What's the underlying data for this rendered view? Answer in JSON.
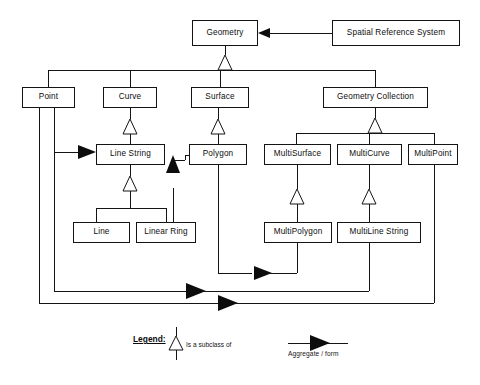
{
  "diagram": {
    "type": "uml-class-diagram",
    "stroke_color": "#141414",
    "fill_color": "#ffffff",
    "nodes": [
      {
        "id": "geometry",
        "label": "Geometry",
        "x": 192,
        "y": 20,
        "w": 66,
        "h": 26
      },
      {
        "id": "srs",
        "label": "Spatial Reference System",
        "x": 332,
        "y": 20,
        "w": 128,
        "h": 26
      },
      {
        "id": "point",
        "label": "Point",
        "x": 22,
        "y": 87,
        "w": 53,
        "h": 21
      },
      {
        "id": "curve",
        "label": "Curve",
        "x": 103,
        "y": 87,
        "w": 54,
        "h": 21
      },
      {
        "id": "surface",
        "label": "Surface",
        "x": 191,
        "y": 87,
        "w": 58,
        "h": 21
      },
      {
        "id": "geometry-collection",
        "label": "Geometry Collection",
        "x": 323,
        "y": 87,
        "w": 105,
        "h": 21
      },
      {
        "id": "line-string",
        "label": "Line String",
        "x": 96,
        "y": 144,
        "w": 69,
        "h": 21
      },
      {
        "id": "polygon",
        "label": "Polygon",
        "x": 189,
        "y": 144,
        "w": 58,
        "h": 21
      },
      {
        "id": "multisurface",
        "label": "MultiSurface",
        "x": 264,
        "y": 144,
        "w": 67,
        "h": 21
      },
      {
        "id": "multicurve",
        "label": "MultiCurve",
        "x": 337,
        "y": 144,
        "w": 65,
        "h": 21
      },
      {
        "id": "multipoint",
        "label": "MultiPoint",
        "x": 408,
        "y": 144,
        "w": 50,
        "h": 21
      },
      {
        "id": "line",
        "label": "Line",
        "x": 73,
        "y": 222,
        "w": 57,
        "h": 21
      },
      {
        "id": "linear-ring",
        "label": "Linear Ring",
        "x": 136,
        "y": 222,
        "w": 60,
        "h": 21
      },
      {
        "id": "multipolygon",
        "label": "MultiPolygon",
        "x": 264,
        "y": 222,
        "w": 68,
        "h": 21
      },
      {
        "id": "multiline-string",
        "label": "MultiLine String",
        "x": 337,
        "y": 222,
        "w": 84,
        "h": 21
      }
    ],
    "relationships": [
      {
        "type": "aggregate",
        "from": "srs",
        "to": "geometry"
      },
      {
        "type": "subclass",
        "from": "point",
        "to": "geometry"
      },
      {
        "type": "subclass",
        "from": "curve",
        "to": "geometry"
      },
      {
        "type": "subclass",
        "from": "surface",
        "to": "geometry"
      },
      {
        "type": "subclass",
        "from": "geometry-collection",
        "to": "geometry"
      },
      {
        "type": "subclass",
        "from": "line-string",
        "to": "curve"
      },
      {
        "type": "subclass",
        "from": "polygon",
        "to": "surface"
      },
      {
        "type": "subclass",
        "from": "multisurface",
        "to": "geometry-collection"
      },
      {
        "type": "subclass",
        "from": "multicurve",
        "to": "geometry-collection"
      },
      {
        "type": "subclass",
        "from": "multipoint",
        "to": "geometry-collection"
      },
      {
        "type": "subclass",
        "from": "line",
        "to": "line-string"
      },
      {
        "type": "subclass",
        "from": "linear-ring",
        "to": "line-string"
      },
      {
        "type": "subclass",
        "from": "multipolygon",
        "to": "multisurface"
      },
      {
        "type": "subclass",
        "from": "multiline-string",
        "to": "multicurve"
      },
      {
        "type": "aggregate",
        "from": "point",
        "to": "line-string"
      },
      {
        "type": "aggregate",
        "from": "linear-ring",
        "to": "polygon"
      },
      {
        "type": "aggregate",
        "from": "polygon",
        "to": "multipolygon"
      },
      {
        "type": "aggregate",
        "from": "point",
        "to": "multiline-string"
      },
      {
        "type": "aggregate",
        "from": "point",
        "to": "multipoint"
      }
    ]
  },
  "legend": {
    "title": "Legend:",
    "subclass_label": "Is a subclass of",
    "aggregate_label": "Aggregate / form"
  }
}
